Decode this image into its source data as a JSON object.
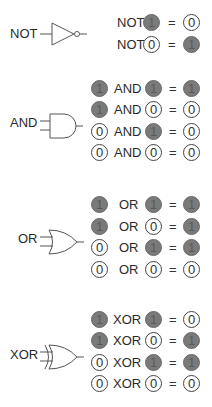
{
  "colors": {
    "one_fill": "#7a7a7a",
    "zero_fill": "#ffffff",
    "stroke": "#444444"
  },
  "equals": "=",
  "gates": [
    {
      "name": "NOT",
      "label": "NOT",
      "rows": [
        {
          "op": "NOT",
          "a": null,
          "b": "1",
          "result": "0"
        },
        {
          "op": "NOT",
          "a": null,
          "b": "0",
          "result": "1"
        }
      ]
    },
    {
      "name": "AND",
      "label": "AND",
      "rows": [
        {
          "a": "1",
          "op": "AND",
          "b": "1",
          "result": "1"
        },
        {
          "a": "1",
          "op": "AND",
          "b": "0",
          "result": "0"
        },
        {
          "a": "0",
          "op": "AND",
          "b": "1",
          "result": "0"
        },
        {
          "a": "0",
          "op": "AND",
          "b": "0",
          "result": "0"
        }
      ]
    },
    {
      "name": "OR",
      "label": "OR",
      "rows": [
        {
          "a": "1",
          "op": "OR",
          "b": "1",
          "result": "1"
        },
        {
          "a": "1",
          "op": "OR",
          "b": "0",
          "result": "1"
        },
        {
          "a": "0",
          "op": "OR",
          "b": "1",
          "result": "1"
        },
        {
          "a": "0",
          "op": "OR",
          "b": "0",
          "result": "0"
        }
      ]
    },
    {
      "name": "XOR",
      "label": "XOR",
      "rows": [
        {
          "a": "1",
          "op": "XOR",
          "b": "1",
          "result": "0"
        },
        {
          "a": "1",
          "op": "XOR",
          "b": "0",
          "result": "1"
        },
        {
          "a": "0",
          "op": "XOR",
          "b": "1",
          "result": "1"
        },
        {
          "a": "0",
          "op": "XOR",
          "b": "0",
          "result": "0"
        }
      ]
    }
  ]
}
